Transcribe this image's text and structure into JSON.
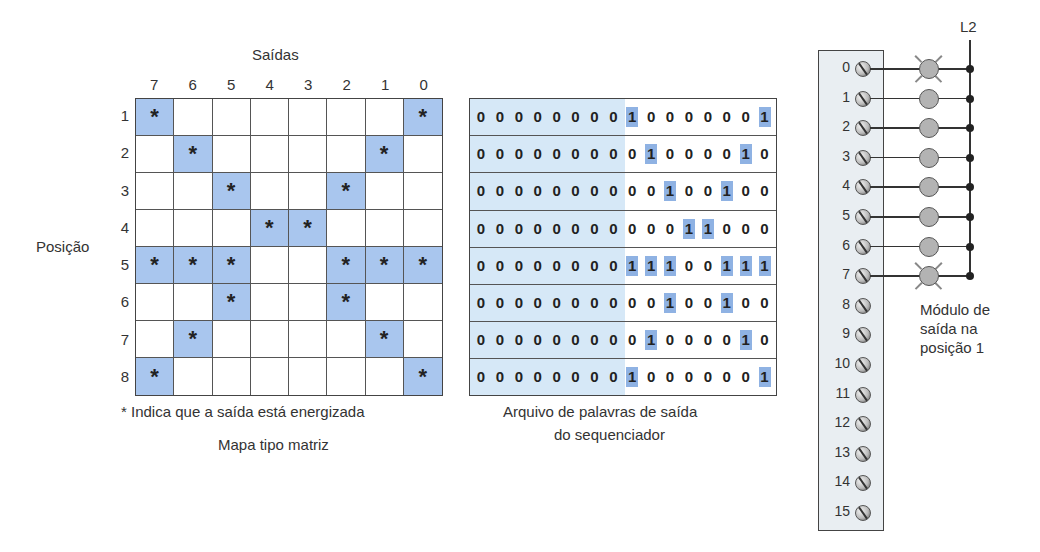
{
  "matrix_map": {
    "columns_title": "Saídas",
    "rows_title": "Posição",
    "column_labels": [
      "7",
      "6",
      "5",
      "4",
      "3",
      "2",
      "1",
      "0"
    ],
    "row_labels": [
      "1",
      "2",
      "3",
      "4",
      "5",
      "6",
      "7",
      "8"
    ],
    "marker": "*",
    "energized": [
      [
        1,
        0,
        0,
        0,
        0,
        0,
        0,
        1
      ],
      [
        0,
        1,
        0,
        0,
        0,
        0,
        1,
        0
      ],
      [
        0,
        0,
        1,
        0,
        0,
        1,
        0,
        0
      ],
      [
        0,
        0,
        0,
        1,
        1,
        0,
        0,
        0
      ],
      [
        1,
        1,
        1,
        0,
        0,
        1,
        1,
        1
      ],
      [
        0,
        0,
        1,
        0,
        0,
        1,
        0,
        0
      ],
      [
        0,
        1,
        0,
        0,
        0,
        0,
        1,
        0
      ],
      [
        1,
        0,
        0,
        0,
        0,
        0,
        0,
        1
      ]
    ],
    "legend": "* Indica que a saída está energizada",
    "caption": "Mapa tipo matriz",
    "highlight_color": "#a9c6ee"
  },
  "word_file": {
    "words": [
      "0000000010000001",
      "0000000001000010",
      "0000000000100100",
      "0000000000011000",
      "0000000011100111",
      "0000000000100100",
      "0000000001000010",
      "0000000010000001"
    ],
    "caption_line1": "Arquivo de palavras de saída",
    "caption_line2": "do sequenciador",
    "upper_byte_shade": "#d6e8f7",
    "one_highlight": "#8fb2e3"
  },
  "output_module": {
    "terminals": [
      "0",
      "1",
      "2",
      "3",
      "4",
      "5",
      "6",
      "7",
      "8",
      "9",
      "10",
      "11",
      "12",
      "13",
      "14",
      "15"
    ],
    "lamps_on": [
      true,
      false,
      false,
      false,
      false,
      false,
      false,
      true
    ],
    "line_label": "L2",
    "caption_line1": "Módulo de",
    "caption_line2": "saída na",
    "caption_line3": "posição 1"
  }
}
